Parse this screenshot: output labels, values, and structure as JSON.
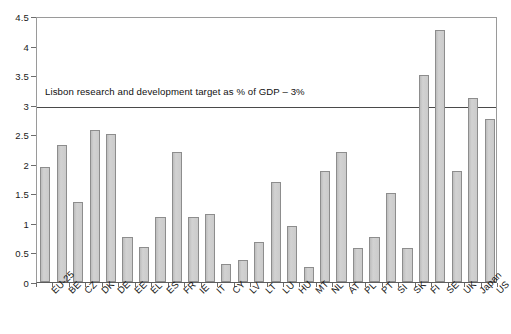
{
  "chart_data": {
    "type": "bar",
    "title": "",
    "subtitle": "",
    "xlabel": "",
    "ylabel": "",
    "ylim": [
      0,
      4.5
    ],
    "ytick_step": 0.5,
    "yticks": [
      "0",
      "0.5",
      "1",
      "1.5",
      "2",
      "2.5",
      "3",
      "3.5",
      "4",
      "4.5"
    ],
    "grid": false,
    "legend": null,
    "categories": [
      "EU-25",
      "BE",
      "CZ",
      "DK",
      "DE",
      "EE",
      "EL",
      "ES",
      "FR",
      "IE",
      "IT",
      "CY",
      "LV",
      "LT",
      "LU",
      "HU",
      "MT",
      "NL",
      "AT",
      "PL",
      "PT",
      "SI",
      "SK",
      "FI",
      "SE",
      "UK",
      "Japan",
      "US"
    ],
    "values": [
      1.95,
      2.32,
      1.35,
      2.58,
      2.5,
      0.77,
      0.6,
      1.1,
      2.2,
      1.1,
      1.15,
      0.3,
      0.38,
      0.67,
      1.7,
      0.95,
      0.26,
      1.87,
      2.2,
      0.57,
      0.76,
      1.5,
      0.57,
      3.5,
      4.27,
      1.87,
      3.12,
      2.75
    ],
    "annotations": [
      {
        "name": "lisbon-target-line",
        "text": "Lisbon research and development target as % of GDP – 3%",
        "value": 3,
        "type": "horizontal-line-with-label"
      }
    ],
    "colors": {
      "bar_fill": "#c9c9c9",
      "bar_border": "#8d8d8d",
      "reference_line": "#4a4a4a",
      "axis": "#5d5d5d",
      "text": "#141414",
      "background": "#ffffff"
    }
  }
}
